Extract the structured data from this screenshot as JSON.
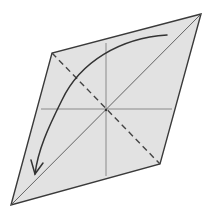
{
  "diagram": {
    "type": "origami-fold-step",
    "colors": {
      "background": "#ffffff",
      "paper_fill": "#e2e2e2",
      "outline": "#3a3a3a",
      "crease": "#8a8a8a",
      "fold_line": "#444444",
      "arrow": "#333333"
    },
    "paper": {
      "corners": {
        "top_right": [
          201,
          14
        ],
        "left": [
          52,
          53
        ],
        "bottom_left": [
          11,
          205
        ],
        "bottom_right": [
          160,
          164
        ]
      }
    },
    "center": [
      106,
      110
    ],
    "creases": [
      {
        "name": "horizontal-crease",
        "from": [
          41,
          109
        ],
        "to": [
          172,
          109
        ]
      },
      {
        "name": "vertical-crease",
        "from": [
          106,
          43
        ],
        "to": [
          106,
          176
        ]
      },
      {
        "name": "diagonal-crease",
        "from": [
          201,
          14
        ],
        "to": [
          11,
          205
        ]
      }
    ],
    "fold_line": {
      "style": "dashed",
      "from": [
        52,
        53
      ],
      "to": [
        160,
        164
      ]
    },
    "arrow": {
      "start": [
        167,
        35
      ],
      "tip": [
        35,
        174
      ],
      "direction": "clockwise-down-left"
    }
  }
}
